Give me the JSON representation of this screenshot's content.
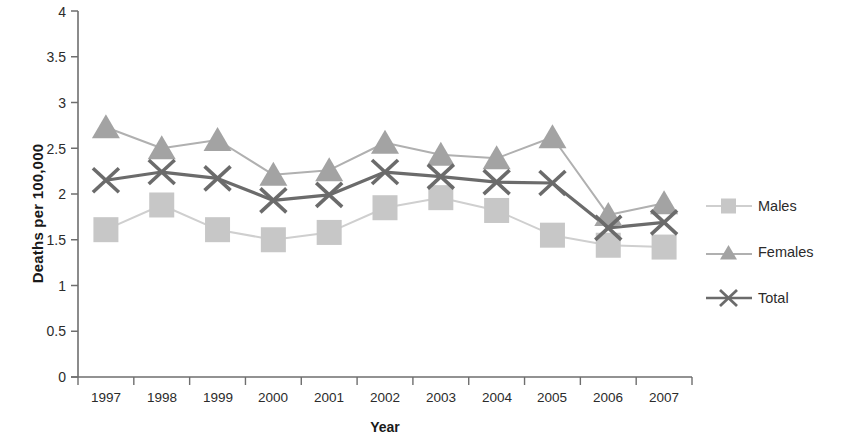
{
  "chart_data": {
    "type": "line",
    "title": "",
    "xlabel": "Year",
    "ylabel": "Deaths per 100,000",
    "categories": [
      "1997",
      "1998",
      "1999",
      "2000",
      "2001",
      "2002",
      "2003",
      "2004",
      "2005",
      "2006",
      "2007"
    ],
    "ylim": [
      0,
      4
    ],
    "yticks": [
      "0",
      "0.5",
      "1",
      "1.5",
      "2",
      "2.5",
      "3",
      "3.5",
      "4"
    ],
    "ytick_values": [
      0,
      0.5,
      1,
      1.5,
      2,
      2.5,
      3,
      3.5,
      4
    ],
    "grid": false,
    "legend_position": "right",
    "series": [
      {
        "name": "Males",
        "marker": "square",
        "color": "#c7c7c7",
        "line_color": "#cfcfcf",
        "values": [
          1.61,
          1.88,
          1.61,
          1.5,
          1.58,
          1.85,
          1.96,
          1.82,
          1.55,
          1.44,
          1.42
        ]
      },
      {
        "name": "Females",
        "marker": "triangle",
        "color": "#a3a3a3",
        "line_color": "#b0b0b0",
        "values": [
          2.73,
          2.5,
          2.59,
          2.21,
          2.26,
          2.56,
          2.43,
          2.39,
          2.62,
          1.77,
          1.9
        ]
      },
      {
        "name": "Total",
        "marker": "cross-x",
        "color": "#6b6b6b",
        "line_color": "#6b6b6b",
        "values": [
          2.15,
          2.24,
          2.17,
          1.93,
          1.99,
          2.24,
          2.19,
          2.13,
          2.12,
          1.63,
          1.69
        ]
      }
    ]
  },
  "axis": {
    "ylabel": "Deaths per 100,000",
    "xlabel": "Year",
    "ytick_labels": [
      "4",
      "3.5",
      "3",
      "2.5",
      "2",
      "1.5",
      "1",
      "0.5",
      "0"
    ],
    "xtick_labels": [
      "1997",
      "1998",
      "1999",
      "2000",
      "2001",
      "2002",
      "2003",
      "2004",
      "2005",
      "2006",
      "2007"
    ]
  },
  "legend": {
    "items": [
      {
        "label": "Males",
        "marker": "square-marker"
      },
      {
        "label": "Females",
        "marker": "triangle-marker"
      },
      {
        "label": "Total",
        "marker": "x-marker"
      }
    ]
  },
  "colors": {
    "males": "#c7c7c7",
    "females": "#a3a3a3",
    "total": "#6b6b6b",
    "axis": "#6e6e6e",
    "text": "#2b2b2b"
  }
}
